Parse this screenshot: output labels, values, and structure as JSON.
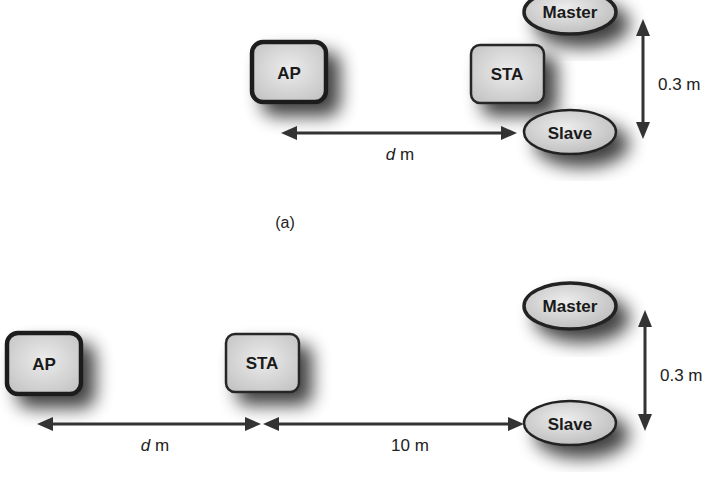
{
  "figure": {
    "panels": [
      {
        "id": "a",
        "caption": "(a)",
        "nodes": {
          "ap": "AP",
          "sta": "STA",
          "master": "Master",
          "slave": "Slave"
        },
        "dimensions": {
          "horizontal": {
            "var": "d",
            "unit": "m"
          },
          "vertical": {
            "text": "0.3 m"
          }
        }
      },
      {
        "id": "b",
        "caption": "",
        "nodes": {
          "ap": "AP",
          "sta": "STA",
          "master": "Master",
          "slave": "Slave"
        },
        "dimensions": {
          "horizontal_left": {
            "var": "d",
            "unit": "m"
          },
          "horizontal_right": {
            "text": "10 m"
          },
          "vertical": {
            "text": "0.3 m"
          }
        }
      }
    ],
    "colors": {
      "node_fill_light": "#e6e6e6",
      "node_fill_dark": "#bdbdbd",
      "node_stroke": "#222222",
      "arrow": "#333333",
      "background": "#ffffff"
    }
  }
}
